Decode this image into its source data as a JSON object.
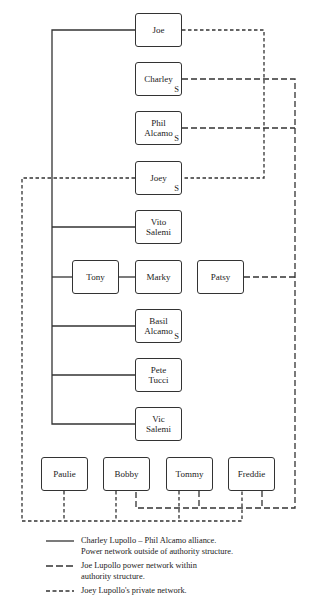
{
  "diagram": {
    "type": "network-organization-chart",
    "nodes": [
      {
        "id": "joe",
        "label": "Joe",
        "s": "",
        "x": 135,
        "y": 13,
        "w": 47,
        "h": 34
      },
      {
        "id": "charley",
        "label": "Charley",
        "s": "S",
        "x": 135,
        "y": 62,
        "w": 47,
        "h": 34
      },
      {
        "id": "phil",
        "label": "Phil\nAlcamo",
        "s": "S",
        "x": 135,
        "y": 111,
        "w": 47,
        "h": 34
      },
      {
        "id": "joey",
        "label": "Joey",
        "s": "S",
        "x": 135,
        "y": 161,
        "w": 47,
        "h": 34
      },
      {
        "id": "vito",
        "label": "Vito\nSalemi",
        "s": "",
        "x": 135,
        "y": 210,
        "w": 47,
        "h": 34
      },
      {
        "id": "tony",
        "label": "Tony",
        "s": "",
        "x": 72,
        "y": 260,
        "w": 47,
        "h": 34
      },
      {
        "id": "marky",
        "label": "Marky",
        "s": "",
        "x": 135,
        "y": 260,
        "w": 47,
        "h": 34
      },
      {
        "id": "patsy",
        "label": "Patsy",
        "s": "",
        "x": 197,
        "y": 260,
        "w": 47,
        "h": 34
      },
      {
        "id": "basil",
        "label": "Basil\nAlcamo",
        "s": "S",
        "x": 135,
        "y": 309,
        "w": 47,
        "h": 34
      },
      {
        "id": "pete",
        "label": "Pete\nTucci",
        "s": "",
        "x": 135,
        "y": 358,
        "w": 47,
        "h": 34
      },
      {
        "id": "vic",
        "label": "Vic\nSalemi",
        "s": "",
        "x": 135,
        "y": 407,
        "w": 47,
        "h": 34
      },
      {
        "id": "paulie",
        "label": "Paulie",
        "s": "",
        "x": 41,
        "y": 457,
        "w": 47,
        "h": 34
      },
      {
        "id": "bobby",
        "label": "Bobby",
        "s": "",
        "x": 103,
        "y": 457,
        "w": 47,
        "h": 34
      },
      {
        "id": "tommy",
        "label": "Tommy",
        "s": "",
        "x": 166,
        "y": 457,
        "w": 47,
        "h": 34
      },
      {
        "id": "freddie",
        "label": "Freddie",
        "s": "",
        "x": 228,
        "y": 457,
        "w": 47,
        "h": 34
      }
    ],
    "edges": {
      "solid": [
        [
          [
            135,
            30
          ],
          [
            52,
            30
          ],
          [
            52,
            424
          ],
          [
            135,
            424
          ]
        ],
        [
          [
            52,
            227
          ],
          [
            135,
            227
          ]
        ],
        [
          [
            52,
            277
          ],
          [
            72,
            277
          ]
        ],
        [
          [
            119,
            277
          ],
          [
            135,
            277
          ]
        ],
        [
          [
            52,
            326
          ],
          [
            135,
            326
          ]
        ],
        [
          [
            52,
            375
          ],
          [
            135,
            375
          ]
        ]
      ],
      "long_dash": [
        [
          [
            182,
            79
          ],
          [
            295,
            79
          ],
          [
            295,
            508
          ],
          [
            136,
            508
          ],
          [
            136,
            491
          ]
        ],
        [
          [
            182,
            128
          ],
          [
            295,
            128
          ]
        ],
        [
          [
            244,
            277
          ],
          [
            295,
            277
          ]
        ],
        [
          [
            199,
            491
          ],
          [
            199,
            508
          ]
        ],
        [
          [
            262,
            491
          ],
          [
            262,
            508
          ]
        ]
      ],
      "short_dash": [
        [
          [
            182,
            30
          ],
          [
            264,
            30
          ],
          [
            264,
            178
          ],
          [
            182,
            178
          ]
        ],
        [
          [
            135,
            178
          ],
          [
            22,
            178
          ],
          [
            22,
            521
          ],
          [
            242,
            521
          ],
          [
            242,
            491
          ]
        ],
        [
          [
            64,
            491
          ],
          [
            64,
            521
          ]
        ],
        [
          [
            116,
            491
          ],
          [
            116,
            521
          ]
        ],
        [
          [
            179,
            491
          ],
          [
            179,
            521
          ]
        ]
      ]
    },
    "colors": {
      "line": "#333333",
      "box_border": "#333333",
      "background": "#ffffff"
    }
  },
  "legend": [
    {
      "style": "solid",
      "text": "Charley Lupollo – Phil Alcamo alliance.\nPower network outside of authority structure."
    },
    {
      "style": "long_dash",
      "text": "Joe Lupollo power network within\nauthority structure."
    },
    {
      "style": "short_dash",
      "text": "Joey Lupollo's private network."
    }
  ]
}
